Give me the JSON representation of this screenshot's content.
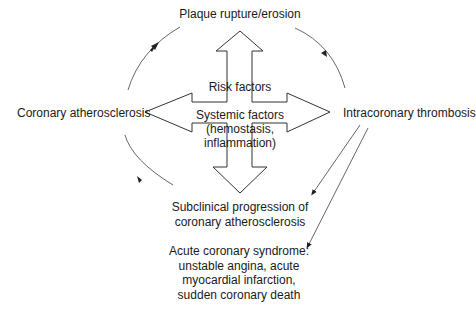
{
  "diagram": {
    "nodes": {
      "top": {
        "label": "Plaque rupture/erosion"
      },
      "left": {
        "label": "Coronary atherosclerosis"
      },
      "right": {
        "label": "Intracoronary thrombosis"
      },
      "bottom": {
        "lines": [
          "Subclinical progression of",
          "coronary atherosclerosis"
        ]
      },
      "outcome": {
        "lines": [
          "Acute coronary syndrome:",
          "unstable angina, acute",
          "myocardial infarction,",
          "sudden coronary death"
        ]
      }
    },
    "center": {
      "shape": "four-way-arrow",
      "risk_label": "Risk factors",
      "systemic_lines": [
        "Systemic factors",
        "(hemostasis,",
        "inflammation)"
      ]
    },
    "edges": [
      {
        "from": "Coronary atherosclerosis",
        "to": "Plaque rupture/erosion",
        "type": "curved-arrow"
      },
      {
        "from": "Plaque rupture/erosion",
        "to": "Intracoronary thrombosis",
        "type": "curved-arrow"
      },
      {
        "from": "Intracoronary thrombosis",
        "to": "Subclinical progression of coronary atherosclerosis",
        "type": "straight-arrow"
      },
      {
        "from": "Intracoronary thrombosis",
        "to": "Acute coronary syndrome",
        "type": "straight-arrow"
      },
      {
        "from": "Subclinical progression of coronary atherosclerosis",
        "to": "Coronary atherosclerosis",
        "type": "curved-arrow"
      }
    ],
    "colors": {
      "stroke": "#444444",
      "text": "#1a1a1a",
      "background": "#ffffff"
    }
  }
}
